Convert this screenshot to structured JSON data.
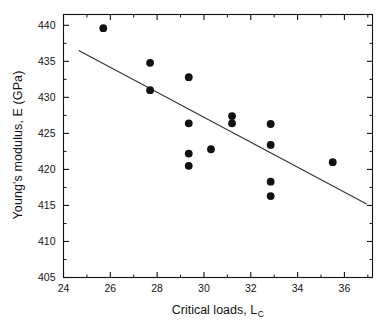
{
  "chart_data": {
    "type": "scatter",
    "title": "",
    "xlabel": "Critical loads, L",
    "xlabel_sub": "C",
    "ylabel": "Young's modulus, E (GPa)",
    "xlim": [
      24,
      37.2
    ],
    "ylim": [
      405,
      441.5
    ],
    "xticks": [
      24,
      26,
      28,
      30,
      32,
      34,
      36
    ],
    "xticklabels": [
      "24",
      "26",
      "28",
      "30",
      "32",
      "34",
      "36"
    ],
    "xminorticks": [
      25,
      27,
      29,
      31,
      33,
      35,
      37
    ],
    "yticks": [
      405,
      410,
      415,
      420,
      425,
      430,
      435,
      440
    ],
    "yticklabels": [
      "405",
      "410",
      "415",
      "420",
      "425",
      "430",
      "435",
      "440"
    ],
    "yminorticks": [
      407.5,
      412.5,
      417.5,
      422.5,
      427.5,
      432.5,
      437.5
    ],
    "grid": false,
    "legend": false,
    "marker": "filled-circle",
    "marker_color": "#111111",
    "marker_size_px": 5.2,
    "points": [
      {
        "x": 25.7,
        "y": 439.6
      },
      {
        "x": 27.7,
        "y": 434.8
      },
      {
        "x": 27.7,
        "y": 431.0
      },
      {
        "x": 29.35,
        "y": 432.8
      },
      {
        "x": 29.35,
        "y": 426.4
      },
      {
        "x": 29.35,
        "y": 422.2
      },
      {
        "x": 29.35,
        "y": 420.5
      },
      {
        "x": 30.3,
        "y": 422.8
      },
      {
        "x": 31.2,
        "y": 427.4
      },
      {
        "x": 31.2,
        "y": 426.4
      },
      {
        "x": 32.85,
        "y": 426.3
      },
      {
        "x": 32.85,
        "y": 423.4
      },
      {
        "x": 32.85,
        "y": 418.3
      },
      {
        "x": 32.85,
        "y": 416.3
      },
      {
        "x": 35.5,
        "y": 421.0
      }
    ],
    "fit_line": {
      "label": "linear fit",
      "color": "#333333",
      "x_start": 24.65,
      "y_start": 436.5,
      "x_end": 36.95,
      "y_end": 415.2
    }
  }
}
